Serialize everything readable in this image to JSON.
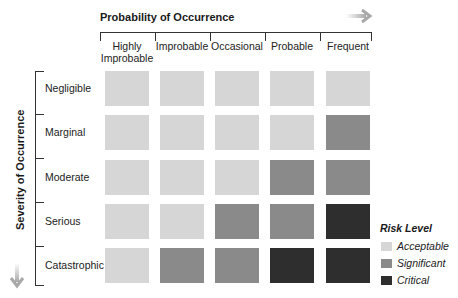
{
  "x_axis": {
    "title": "Probability of Occurrence",
    "arrow_icon": "arrow-right-icon",
    "categories": [
      "Highly Improbable",
      "Improbable",
      "Occasional",
      "Probable",
      "Frequent"
    ],
    "category_lines": [
      [
        "Highly",
        "Improbable"
      ],
      [
        "Improbable"
      ],
      [
        "Occasional"
      ],
      [
        "Probable"
      ],
      [
        "Frequent"
      ]
    ]
  },
  "y_axis": {
    "title": "Severity of Occurrence",
    "arrow_icon": "arrow-down-icon",
    "categories": [
      "Negligible",
      "Marginal",
      "Moderate",
      "Serious",
      "Catastrophic"
    ]
  },
  "legend": {
    "title": "Risk Level",
    "items": [
      {
        "key": "acceptable",
        "label": "Acceptable",
        "color": "#d6d6d6"
      },
      {
        "key": "significant",
        "label": "Significant",
        "color": "#8a8a8a"
      },
      {
        "key": "critical",
        "label": "Critical",
        "color": "#2e2e2e"
      }
    ]
  },
  "chart_data": {
    "type": "heatmap",
    "title": "",
    "xlabel": "Probability of Occurrence",
    "ylabel": "Severity of Occurrence",
    "x_categories": [
      "Highly Improbable",
      "Improbable",
      "Occasional",
      "Probable",
      "Frequent"
    ],
    "y_categories": [
      "Negligible",
      "Marginal",
      "Moderate",
      "Serious",
      "Catastrophic"
    ],
    "levels": [
      "Acceptable",
      "Significant",
      "Critical"
    ],
    "matrix": [
      [
        "Acceptable",
        "Acceptable",
        "Acceptable",
        "Acceptable",
        "Acceptable"
      ],
      [
        "Acceptable",
        "Acceptable",
        "Acceptable",
        "Acceptable",
        "Significant"
      ],
      [
        "Acceptable",
        "Acceptable",
        "Acceptable",
        "Significant",
        "Significant"
      ],
      [
        "Acceptable",
        "Acceptable",
        "Significant",
        "Significant",
        "Critical"
      ],
      [
        "Acceptable",
        "Significant",
        "Significant",
        "Critical",
        "Critical"
      ]
    ],
    "legend_position": "bottom-right"
  }
}
